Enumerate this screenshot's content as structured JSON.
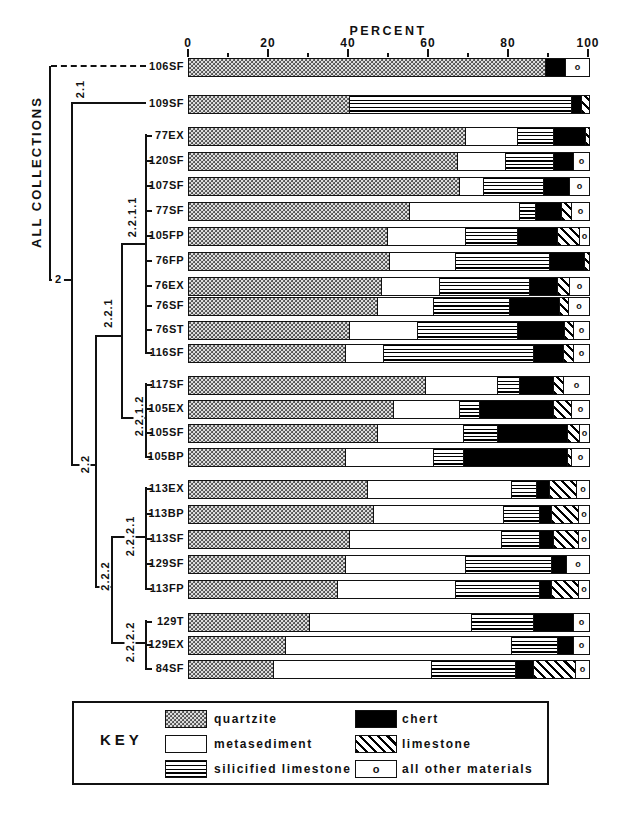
{
  "axis": {
    "title": "PERCENT",
    "major_ticks": [
      0,
      20,
      40,
      60,
      80,
      100
    ],
    "minor_ticks": [
      10,
      30,
      50,
      70,
      90
    ]
  },
  "dendrogram": {
    "root_label": "ALL COLLECTIONS",
    "clusters": {
      "c2": "2",
      "c21": "2.1",
      "c22": "2.2",
      "c221": "2.2.1",
      "c2211": "2.2.1.1",
      "c2212": "2.2.1.2",
      "c222": "2.2.2",
      "c2221": "2.2.2.1",
      "c2222": "2.2.2.2"
    }
  },
  "key": {
    "label": "KEY",
    "other_symbol": "o",
    "entries": [
      {
        "name": "quartzite",
        "pattern": "dots"
      },
      {
        "name": "metasediment",
        "pattern": "plain"
      },
      {
        "name": "silicified limestone",
        "pattern": "horizontal-lines"
      },
      {
        "name": "chert",
        "pattern": "solid-black"
      },
      {
        "name": "limestone",
        "pattern": "diagonal-hatch"
      },
      {
        "name": "all other materials",
        "pattern": "circle-symbol"
      }
    ]
  },
  "chart_data": {
    "type": "bar",
    "stacked": true,
    "orientation": "horizontal",
    "xlabel": "PERCENT",
    "xlim": [
      0,
      100
    ],
    "grid": false,
    "series_order": [
      "quartzite",
      "metasediment",
      "silicified limestone",
      "chert",
      "limestone",
      "all other materials"
    ],
    "rows": [
      {
        "label": "106SF",
        "cluster": "all collections",
        "values": [
          89,
          0,
          0,
          5,
          0,
          6
        ]
      },
      {
        "label": "109SF",
        "cluster": "2.1",
        "values": [
          40,
          0,
          55.5,
          2.5,
          2,
          0
        ]
      },
      {
        "label": "77EX",
        "cluster": "2.2.1.1",
        "values": [
          69,
          13,
          9,
          8,
          1,
          0
        ]
      },
      {
        "label": "120SF",
        "cluster": "2.2.1.1",
        "values": [
          67,
          12,
          12,
          5,
          0,
          4
        ]
      },
      {
        "label": "107SF",
        "cluster": "2.2.1.1",
        "values": [
          67.5,
          6,
          15,
          6.5,
          0,
          5
        ]
      },
      {
        "label": "77SF",
        "cluster": "2.2.1.1",
        "values": [
          55,
          27.5,
          4,
          6.5,
          2.5,
          4.5
        ]
      },
      {
        "label": "105FP",
        "cluster": "2.2.1.1",
        "values": [
          49.5,
          19.5,
          13,
          10,
          5.5,
          2.5
        ]
      },
      {
        "label": "76FP",
        "cluster": "2.2.1.1",
        "values": [
          50,
          16.5,
          23.5,
          8.8,
          1.2,
          0
        ]
      },
      {
        "label": "76EX",
        "cluster": "2.2.1.1",
        "values": [
          48,
          14.5,
          22.5,
          7,
          3,
          5
        ]
      },
      {
        "label": "76SF",
        "cluster": "2.2.1.1",
        "values": [
          47,
          14,
          19,
          12.5,
          2.2,
          5.3
        ]
      },
      {
        "label": "76ST",
        "cluster": "2.2.1.1",
        "values": [
          40,
          17,
          25,
          11.8,
          2.2,
          4
        ]
      },
      {
        "label": "116SF",
        "cluster": "2.2.1.1",
        "values": [
          39,
          9.5,
          37.5,
          7.5,
          2.5,
          4
        ]
      },
      {
        "label": "117SF",
        "cluster": "2.2.1.2",
        "values": [
          59,
          18,
          5.5,
          8.5,
          2.5,
          6.5
        ]
      },
      {
        "label": "105EX",
        "cluster": "2.2.1.2",
        "values": [
          51,
          16.5,
          5,
          18.5,
          4.5,
          4.5
        ]
      },
      {
        "label": "105SF",
        "cluster": "2.2.1.2",
        "values": [
          47,
          21.5,
          8.5,
          17.5,
          3,
          2.5
        ]
      },
      {
        "label": "105BP",
        "cluster": "2.2.1.2",
        "values": [
          39,
          22,
          7.5,
          26,
          1,
          4.5
        ]
      },
      {
        "label": "113EX",
        "cluster": "2.2.2.1",
        "values": [
          44.5,
          36,
          6.3,
          3.2,
          6.8,
          3.2
        ]
      },
      {
        "label": "113BP",
        "cluster": "2.2.2.1",
        "values": [
          46,
          32.5,
          9,
          3,
          6.7,
          2.8
        ]
      },
      {
        "label": "113SF",
        "cluster": "2.2.2.1",
        "values": [
          40,
          38,
          9.5,
          3.5,
          6.2,
          2.8
        ]
      },
      {
        "label": "129SF",
        "cluster": "2.2.2.1",
        "values": [
          39,
          30,
          21.5,
          3.7,
          0,
          5.8
        ]
      },
      {
        "label": "113FP",
        "cluster": "2.2.2.1",
        "values": [
          37,
          29.5,
          21,
          3,
          6.7,
          2.8
        ]
      },
      {
        "label": "129T",
        "cluster": "2.2.2.2",
        "values": [
          30,
          40.5,
          15.5,
          10,
          0,
          4
        ]
      },
      {
        "label": "129EX",
        "cluster": "2.2.2.2",
        "values": [
          24,
          56.5,
          11.5,
          4,
          0,
          4
        ]
      },
      {
        "label": "84SF",
        "cluster": "2.2.2.2",
        "values": [
          21,
          39.5,
          21,
          4.5,
          10.5,
          3.5
        ]
      }
    ]
  }
}
